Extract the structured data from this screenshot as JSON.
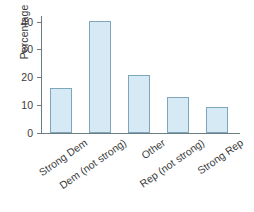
{
  "chart_data": {
    "type": "bar",
    "title": "",
    "subtitle": "",
    "xlabel": "",
    "ylabel": "Percentage",
    "categories": [
      "Strong Dem",
      "Dem (not strong)",
      "Other",
      "Rep (not strong)",
      "Strong Rep"
    ],
    "values": [
      16.0,
      40.2,
      20.7,
      12.8,
      9.3
    ],
    "ylim": [
      0,
      42
    ],
    "yticks": [
      0,
      10,
      20,
      30,
      40
    ],
    "ytick_labels": [
      "0",
      "10",
      "20",
      "30",
      "40"
    ],
    "grid": false,
    "legend": null,
    "annotations": [],
    "bar_fill_color": "#d6eaf5",
    "bar_edge_color": "#7fa6bb",
    "axis_color": "#6f7b82",
    "background_color": "#ffffff"
  }
}
